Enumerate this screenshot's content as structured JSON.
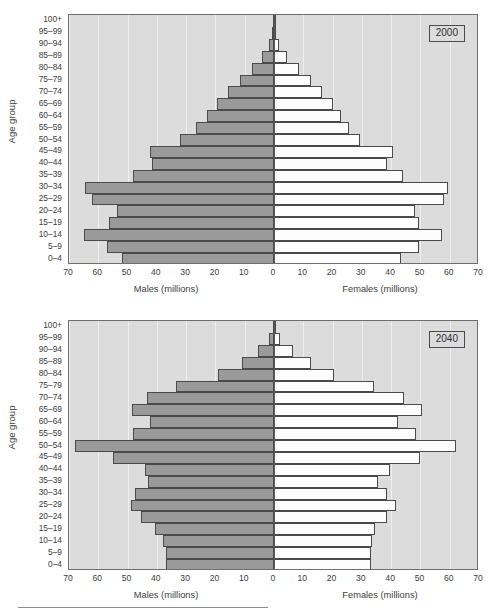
{
  "page": {
    "background": "#ffffff",
    "top_trace_text": "",
    "footer_rule": true
  },
  "palette": {
    "plot_background": "#dcdcdc",
    "gridline": "#efefef",
    "male_bar": "#9a9a9a",
    "female_bar": "#fdfdfd",
    "bar_outline": "#4a4a4a",
    "axis_line": "#5a5a5a",
    "text": "#3d3d3d"
  },
  "axis": {
    "y_title": "Age group",
    "age_groups": [
      "100+",
      "95–99",
      "90–94",
      "85–89",
      "80–84",
      "75–79",
      "70–74",
      "65–69",
      "60–64",
      "55–59",
      "50–54",
      "45–49",
      "40–44",
      "35–39",
      "30–34",
      "25–29",
      "20–24",
      "15–19",
      "10–14",
      "5–9",
      "0–4"
    ],
    "x_ticks": [
      "70",
      "60",
      "50",
      "40",
      "30",
      "20",
      "10",
      "0",
      "10",
      "20",
      "30",
      "40",
      "50",
      "60",
      "70"
    ],
    "x_tick_values": [
      -70,
      -60,
      -50,
      -40,
      -30,
      -20,
      -10,
      0,
      10,
      20,
      30,
      40,
      50,
      60,
      70
    ],
    "x_min": -70,
    "x_max": 70,
    "caption_left": "Males (millions)",
    "caption_right": "Females (millions)"
  },
  "chart_data": [
    {
      "type": "bar",
      "id": "pyramid-2000",
      "title": "2000",
      "year_label": "2000",
      "orientation": "horizontal-diverging",
      "xlabel": "Males (millions)",
      "xlabel_right": "Females (millions)",
      "ylabel": "Age group",
      "xlim": [
        -70,
        70
      ],
      "grid": true,
      "legend": "none",
      "categories": [
        "100+",
        "95–99",
        "90–94",
        "85–89",
        "80–84",
        "75–79",
        "70–74",
        "65–69",
        "60–64",
        "55–59",
        "50–54",
        "45–49",
        "40–44",
        "35–39",
        "30–34",
        "25–29",
        "20–24",
        "15–19",
        "10–14",
        "5–9",
        "0–4"
      ],
      "series": [
        {
          "name": "Males (millions)",
          "side": "left",
          "color": "#9a9a9a",
          "values": [
            0.3,
            0.6,
            1.6,
            4.0,
            7.6,
            11.5,
            15.8,
            19.5,
            22.8,
            26.5,
            32.0,
            42.5,
            41.6,
            48.0,
            64.5,
            62.0,
            53.5,
            56.5,
            65.0,
            57.0,
            52.0
          ]
        },
        {
          "name": "Females (millions)",
          "side": "right",
          "color": "#fdfdfd",
          "values": [
            0.3,
            0.7,
            1.8,
            4.3,
            8.5,
            12.5,
            16.5,
            20.0,
            23.0,
            25.5,
            29.5,
            40.5,
            38.5,
            44.0,
            59.5,
            58.0,
            48.0,
            49.5,
            57.5,
            49.5,
            43.5
          ]
        }
      ]
    },
    {
      "type": "bar",
      "id": "pyramid-2040",
      "title": "2040",
      "year_label": "2040",
      "orientation": "horizontal-diverging",
      "xlabel": "Males (millions)",
      "xlabel_right": "Females (millions)",
      "ylabel": "Age group",
      "xlim": [
        -70,
        70
      ],
      "grid": true,
      "legend": "none",
      "categories": [
        "100+",
        "95–99",
        "90–94",
        "85–89",
        "80–84",
        "75–79",
        "70–74",
        "65–69",
        "60–64",
        "55–59",
        "50–54",
        "45–49",
        "40–44",
        "35–39",
        "30–34",
        "25–29",
        "20–24",
        "15–19",
        "10–14",
        "5–9",
        "0–4"
      ],
      "series": [
        {
          "name": "Males (millions)",
          "side": "left",
          "color": "#9a9a9a",
          "values": [
            0.5,
            1.8,
            5.5,
            11.0,
            19.0,
            33.5,
            43.5,
            48.5,
            42.5,
            48.0,
            68.0,
            55.0,
            44.0,
            43.0,
            47.5,
            49.0,
            45.5,
            40.5,
            38.0,
            37.0,
            37.0
          ]
        },
        {
          "name": "Females (millions)",
          "side": "right",
          "color": "#fdfdfd",
          "values": [
            0.5,
            2.2,
            6.5,
            12.5,
            20.5,
            34.0,
            44.5,
            50.5,
            42.5,
            48.5,
            62.0,
            50.0,
            39.5,
            35.5,
            38.5,
            41.5,
            38.5,
            34.5,
            33.5,
            33.0,
            33.0
          ]
        }
      ]
    }
  ]
}
